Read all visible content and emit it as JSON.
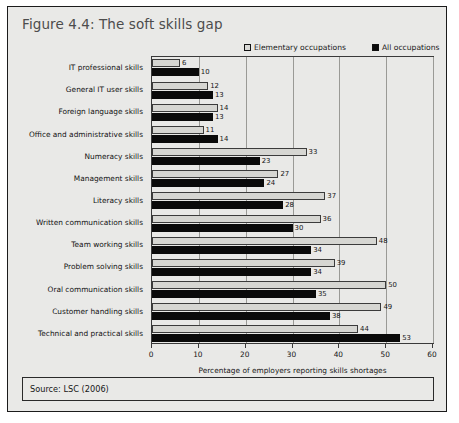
{
  "figure": {
    "title": "Figure 4.4: The soft skills gap",
    "source": "Source: LSC (2006)"
  },
  "legend": {
    "items": [
      {
        "label": "Elementary occupations",
        "swatch": "elementary-swatch",
        "color": "#d9d9d6"
      },
      {
        "label": "All occupations",
        "swatch": "all-swatch",
        "color": "#0b0b0b"
      }
    ]
  },
  "chart_data": {
    "type": "bar",
    "orientation": "horizontal",
    "title": "Figure 4.4: The soft skills gap",
    "xlabel": "Percentage of employers reporting skills shortages",
    "ylabel": "",
    "xlim": [
      0,
      60
    ],
    "xticks": [
      0,
      10,
      20,
      30,
      40,
      50,
      60
    ],
    "grid": true,
    "legend_position": "top-right",
    "categories": [
      "IT professional skills",
      "General IT user skills",
      "Foreign language skills",
      "Office and administrative skills",
      "Numeracy skills",
      "Management skills",
      "Literacy skills",
      "Written communication skills",
      "Team working skills",
      "Problem solving skills",
      "Oral communication skills",
      "Customer handling skills",
      "Technical and practical skills"
    ],
    "series": [
      {
        "name": "Elementary occupations",
        "color": "#d9d9d6",
        "values": [
          6,
          12,
          14,
          11,
          33,
          27,
          37,
          36,
          48,
          39,
          50,
          49,
          44
        ]
      },
      {
        "name": "All occupations",
        "color": "#0b0b0b",
        "values": [
          10,
          13,
          13,
          14,
          23,
          24,
          28,
          30,
          34,
          34,
          35,
          38,
          53
        ]
      }
    ]
  }
}
